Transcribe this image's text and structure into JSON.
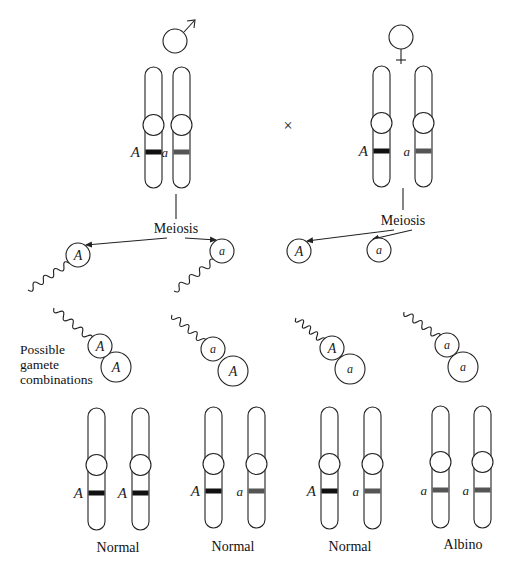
{
  "figure": {
    "cross_symbol": "×",
    "parents": [
      {
        "sex": "male",
        "symbol_icon": "male-symbol-icon",
        "alleles": [
          "A",
          "a"
        ],
        "process_label": "Meiosis",
        "gametes": [
          "A",
          "a"
        ]
      },
      {
        "sex": "female",
        "symbol_icon": "female-symbol-icon",
        "alleles": [
          "A",
          "a"
        ],
        "process_label": "Meiosis",
        "gametes": [
          "A",
          "a"
        ]
      }
    ],
    "combinations_label_lines": [
      "Possible",
      "gamete",
      "combinations"
    ],
    "combinations": [
      {
        "sperm": "A",
        "egg": "A",
        "alleles": [
          "A",
          "A"
        ],
        "phenotype": "Normal"
      },
      {
        "sperm": "a",
        "egg": "A",
        "alleles": [
          "A",
          "a"
        ],
        "phenotype": "Normal"
      },
      {
        "sperm": "A",
        "egg": "a",
        "alleles": [
          "A",
          "a"
        ],
        "phenotype": "Normal"
      },
      {
        "sperm": "a",
        "egg": "a",
        "alleles": [
          "a",
          "a"
        ],
        "phenotype": "Albino"
      }
    ]
  },
  "colors": {
    "dominant_band": "#111111",
    "recessive_band": "#555555",
    "line": "#222222"
  }
}
